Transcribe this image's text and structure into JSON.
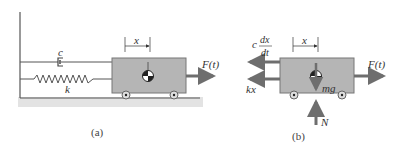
{
  "diagram": {
    "panel_a": {
      "caption": "(a)",
      "damper_label": "c",
      "spring_label": "k",
      "displacement_label": "x",
      "force_label": "F(t)"
    },
    "panel_b": {
      "caption": "(b)",
      "damping_force_coef": "c",
      "damping_force_num": "dx",
      "damping_force_den": "dt",
      "spring_force_label": "kx",
      "displacement_label": "x",
      "weight_label": "mg",
      "normal_label": "N",
      "force_label": "F(t)"
    },
    "colors": {
      "block_fill": "#b5b5b5",
      "block_stroke": "#777777",
      "arrow": "#6e6e6e",
      "ground": "#cfcfcf",
      "line": "#555555"
    }
  }
}
